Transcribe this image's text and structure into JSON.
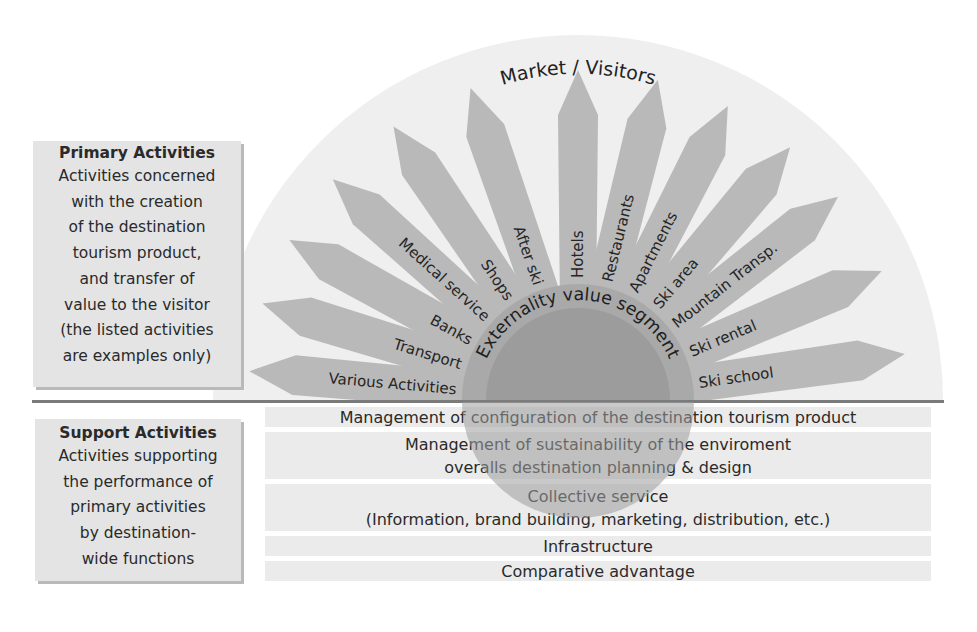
{
  "diagram": {
    "title_arc": "Market / Visitors",
    "center_label": "Externality value segment",
    "colors": {
      "background_semicircle": "#efefef",
      "ray": "#b9b9b9",
      "center_circle": "#9c9c9c",
      "center_ring": "#a9a9a9",
      "divider": "#7a7a7a",
      "box_fill": "#e4e4e4",
      "bar_fill": "#ebebeb"
    }
  },
  "primary_box": {
    "title": "Primary Activities",
    "lines": [
      "Activities concerned",
      "with the creation",
      "of the destination",
      "tourism product,",
      "and transfer of",
      "value to the visitor",
      "(the listed activities",
      "are examples only)"
    ]
  },
  "support_box": {
    "title": "Support Activities",
    "lines": [
      "Activities supporting",
      "the performance of",
      "primary activities",
      "by destination-",
      "wide functions"
    ]
  },
  "rays": [
    {
      "label": "Various Activities",
      "angle": 175
    },
    {
      "label": "Transport",
      "angle": 163
    },
    {
      "label": "Banks",
      "angle": 151
    },
    {
      "label": "Medical service",
      "angle": 138
    },
    {
      "label": "Shops",
      "angle": 124
    },
    {
      "label": "After ski",
      "angle": 109
    },
    {
      "label": "Hotels",
      "angle": 90
    },
    {
      "label": "Restaurants",
      "angle": 76
    },
    {
      "label": "Apartments",
      "angle": 63
    },
    {
      "label": "Ski area",
      "angle": 50
    },
    {
      "label": "Mountain Transp.",
      "angle": 38
    },
    {
      "label": "Ski rental",
      "angle": 23
    },
    {
      "label": "Ski school",
      "angle": 8
    }
  ],
  "support_bars": [
    {
      "lines": [
        "Management of configuration of the destination tourism product"
      ]
    },
    {
      "lines": [
        "Management of sustainability of the enviroment",
        "overalls destination planning & design"
      ]
    },
    {
      "lines": [
        "Collective service",
        "(Information, brand building, marketing, distribution, etc.)"
      ]
    },
    {
      "lines": [
        "Infrastructure"
      ]
    },
    {
      "lines": [
        "Comparative advantage"
      ]
    }
  ]
}
